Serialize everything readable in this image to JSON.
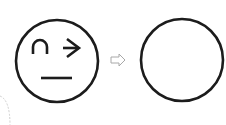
{
  "diagram": {
    "nodes": [
      {
        "id": "face",
        "type": "circle-face",
        "features": [
          "arc-eyebrow",
          "arrow-eye",
          "flat-mouth"
        ]
      },
      {
        "id": "arrow",
        "type": "hollow-right-arrow"
      },
      {
        "id": "empty",
        "type": "empty-circle"
      }
    ],
    "colors": {
      "stroke": "#1a1a1a",
      "arrow": "#b0b0b0",
      "dashed": "#cccccc",
      "background": "#ffffff"
    }
  }
}
